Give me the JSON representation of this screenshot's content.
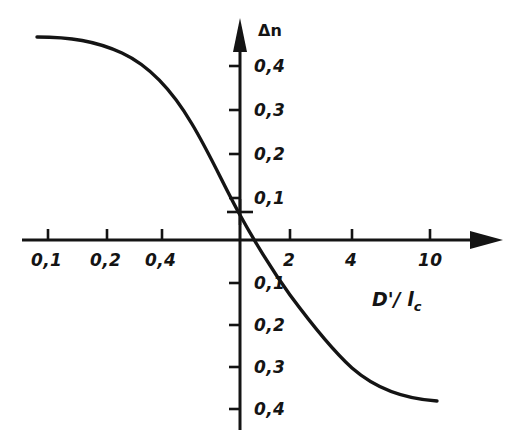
{
  "figure": {
    "background_color": "#ffffff",
    "ink_color": "#141414",
    "width": 519,
    "height": 437
  },
  "axes": {
    "y_axis_title": "Δn",
    "x_axis_title_main": "D'/ l",
    "x_axis_title_sub": "c",
    "x_axis_title_full": "D'/ l_c",
    "origin_px": {
      "x": 240,
      "y": 240
    },
    "x_arrow_tip_px": 503,
    "y_arrow_tip_px": 18
  },
  "x_ticks": [
    {
      "label": "0,1",
      "value": 0.1,
      "px": 48
    },
    {
      "label": "0,2",
      "value": 0.2,
      "px": 107
    },
    {
      "label": "0,4",
      "value": 0.4,
      "px": 162
    },
    {
      "label": "2",
      "value": 2,
      "px": 290
    },
    {
      "label": "4",
      "value": 4,
      "px": 352
    },
    {
      "label": "10",
      "value": 10,
      "px": 430
    }
  ],
  "y_ticks_positive": [
    {
      "label": "0,4",
      "value": 0.4,
      "px": 66
    },
    {
      "label": "0,3",
      "value": 0.3,
      "px": 110
    },
    {
      "label": "0,2",
      "value": 0.2,
      "px": 154
    },
    {
      "label": "0,1",
      "value": 0.1,
      "px": 198
    }
  ],
  "y_ticks_negative": [
    {
      "label": "0,1",
      "value": -0.1,
      "px": 283
    },
    {
      "label": "0,2",
      "value": -0.2,
      "px": 325
    },
    {
      "label": "0,3",
      "value": -0.3,
      "px": 367
    },
    {
      "label": "0,4",
      "value": -0.4,
      "px": 409
    }
  ],
  "marker": {
    "type": "cross",
    "px": {
      "x": 240,
      "y": 212
    },
    "value": {
      "x": 1.0,
      "y": 0.065
    }
  },
  "curve": {
    "path": "M 37,37 C 70,37 96,41 122,53 C 150,66 172,90 192,124 C 210,154 224,186 240,215 C 256,244 272,270 290,295 C 310,322 330,348 352,368 C 376,389 406,399 437,401",
    "stroke_width": 3.4
  },
  "chart_data": {
    "type": "line",
    "title": "",
    "subtitle": "",
    "xlabel": "D'/ l_c",
    "ylabel": "Δn",
    "xscale": "log",
    "yscale": "linear",
    "xlim": [
      0.08,
      16
    ],
    "ylim": [
      -0.47,
      0.5
    ],
    "grid": false,
    "legend": null,
    "x_tick_labels": [
      "0,1",
      "0,2",
      "0,4",
      "2",
      "4",
      "10"
    ],
    "y_tick_labels": [
      "0,4",
      "0,3",
      "0,2",
      "0,1",
      "0,1",
      "0,2",
      "0,3",
      "0,4"
    ],
    "series": [
      {
        "name": "Δn",
        "x": [
          0.085,
          0.1,
          0.13,
          0.17,
          0.2,
          0.26,
          0.32,
          0.4,
          0.5,
          0.63,
          0.8,
          1.0,
          1.25,
          1.6,
          2.0,
          2.5,
          3.2,
          4.0,
          5.0,
          6.3,
          8.0,
          10.0,
          13.0
        ],
        "y": [
          0.465,
          0.465,
          0.46,
          0.45,
          0.44,
          0.415,
          0.385,
          0.345,
          0.29,
          0.22,
          0.145,
          0.058,
          -0.03,
          -0.105,
          -0.17,
          -0.235,
          -0.285,
          -0.33,
          -0.365,
          -0.39,
          -0.405,
          -0.412,
          -0.415
        ]
      }
    ],
    "annotations": [
      {
        "type": "cross-marker",
        "x": 1.0,
        "y": 0.065,
        "label": ""
      }
    ]
  }
}
